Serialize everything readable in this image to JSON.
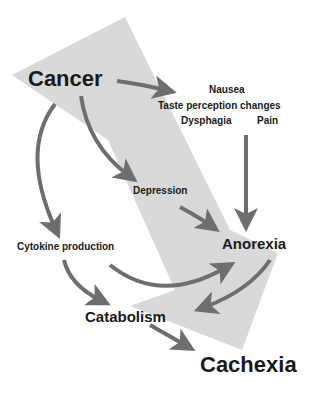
{
  "diagram": {
    "nodes": {
      "cancer": "Cancer",
      "nausea": "Nausea",
      "taste": "Taste perception changes",
      "dysphagia": "Dysphagia",
      "pain": "Pain",
      "depression": "Depression",
      "cytokine": "Cytokine production",
      "anorexia": "Anorexia",
      "catabolism": "Catabolism",
      "cachexia": "Cachexia"
    },
    "colors": {
      "background_arrow": "#d9d9d9",
      "arrows": "#6e6e6e",
      "text": "#1a1a1a"
    }
  }
}
